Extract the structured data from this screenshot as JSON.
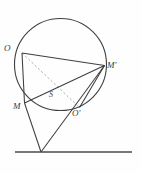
{
  "figure": {
    "background_color": "#fefefe",
    "stroke_color": "#3f3f3f",
    "dashed_stroke_color": "#9a9a9a",
    "baseline_color": "#4a4a4a",
    "label_color": "#3a3a3a"
  },
  "circle": {
    "name": "main-circle",
    "cx": 60.5,
    "cy": 64.5,
    "r": 46.0,
    "stroke_width": 1.1
  },
  "points": [
    {
      "id": "O",
      "label": "O",
      "x": 22.0,
      "y": 53.0,
      "label_x": 4.0,
      "label_y": 51.0
    },
    {
      "id": "M'",
      "label": "M'",
      "x": 104.5,
      "y": 65.5,
      "label_x": 107.0,
      "label_y": 68.0
    },
    {
      "id": "M",
      "label": "M",
      "x": 24.5,
      "y": 103.0,
      "label_x": 13.0,
      "label_y": 109.0
    },
    {
      "id": "O'",
      "label": "O'",
      "x": 79.5,
      "y": 107.5,
      "label_x": 73.0,
      "label_y": 116.0
    },
    {
      "id": "S",
      "label": "S",
      "x": 58.5,
      "y": 93.5,
      "label_x": 49.0,
      "label_y": 97.0
    },
    {
      "id": "V",
      "label": "",
      "x": 41.0,
      "y": 152.0,
      "label_x": 41.0,
      "label_y": 152.0
    }
  ],
  "segments": [
    {
      "name": "chord-O-M",
      "from": "O",
      "to": "M",
      "style": "solid"
    },
    {
      "name": "chord-O-Mprime",
      "from": "O",
      "to": "M'",
      "style": "solid"
    },
    {
      "name": "chord-M-Mprime",
      "from": "M",
      "to": "M'",
      "style": "solid"
    },
    {
      "name": "chord-Mprime-Oprime",
      "from": "M'",
      "to": "O'",
      "style": "solid"
    },
    {
      "name": "diagonal-O-Oprime",
      "from": "O",
      "to": "O'",
      "style": "dashed"
    },
    {
      "name": "tangent-line-V-M",
      "from": "V",
      "to": "M",
      "style": "solid"
    },
    {
      "name": "tangent-line-V-Mprime",
      "from": "V",
      "to": "M'",
      "style": "solid"
    }
  ],
  "baseline": {
    "name": "horizontal-base-line",
    "x1": 15.0,
    "y1": 152.0,
    "x2": 132.0,
    "y2": 152.0,
    "stroke_width": 1.4
  }
}
